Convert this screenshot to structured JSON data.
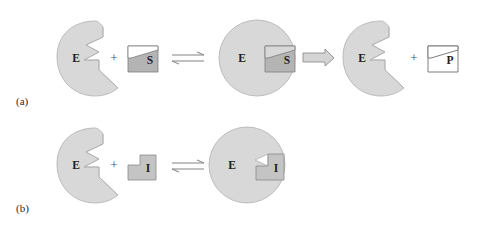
{
  "figure": {
    "background_color": "#ffffff"
  },
  "colors": {
    "enzyme_fill": "#d8d8d8",
    "enzyme_stroke": "#b0b0b0",
    "substrate_fill": "#b4b4b4",
    "substrate_stroke": "#7d7d7d",
    "inhibitor_fill": "#c4c4c4",
    "inhibitor_stroke": "#8a8a8a",
    "product_fill": "#ffffff",
    "product_stroke": "#6f6f6f",
    "arrow_fill": "#d4d4d4",
    "arrow_stroke": "#8e8e8e",
    "text_color": "#1f1f1f",
    "label_color": "#2b2b2b"
  },
  "panels": [
    {
      "id": "a",
      "label": "(a)",
      "description": "Enzyme plus substrate forms enzyme-substrate complex which converts to enzyme plus product",
      "steps": [
        {
          "kind": "enzyme",
          "label": "E"
        },
        {
          "kind": "operator",
          "label": "+"
        },
        {
          "kind": "substrate",
          "label": "S"
        },
        {
          "kind": "arrow",
          "label": "⇌",
          "arrow_type": "equilibrium"
        },
        {
          "kind": "complex",
          "enzyme_label": "E",
          "ligand_label": "S"
        },
        {
          "kind": "arrow",
          "label": "⇒",
          "arrow_type": "forward"
        },
        {
          "kind": "enzyme",
          "label": "E"
        },
        {
          "kind": "operator",
          "label": "+"
        },
        {
          "kind": "product",
          "label": "P"
        }
      ]
    },
    {
      "id": "b",
      "label": "(b)",
      "description": "Enzyme plus inhibitor forms enzyme-inhibitor complex",
      "steps": [
        {
          "kind": "enzyme",
          "label": "E"
        },
        {
          "kind": "operator",
          "label": "+"
        },
        {
          "kind": "inhibitor",
          "label": "I"
        },
        {
          "kind": "arrow",
          "label": "⇌",
          "arrow_type": "equilibrium"
        },
        {
          "kind": "complex",
          "enzyme_label": "E",
          "ligand_label": "I"
        }
      ]
    }
  ],
  "labels": {
    "panel_a": "(a)",
    "panel_b": "(b)",
    "enzyme_a1": "E",
    "enzyme_a2": "E",
    "enzyme_a3": "E",
    "enzyme_b1": "E",
    "enzyme_b2": "E",
    "substrate_free": "S",
    "substrate_bound": "S",
    "product": "P",
    "inhibitor_free": "I",
    "inhibitor_bound": "I",
    "plus_a1": "+",
    "plus_a2": "+",
    "plus_b1": "+"
  }
}
